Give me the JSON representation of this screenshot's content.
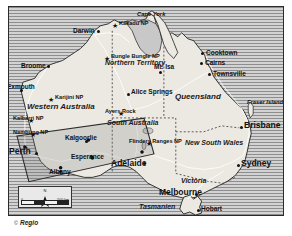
{
  "map": {
    "title": "Australia overview map",
    "language_note": "Tasmanien",
    "colors": {
      "ocean_hatch_dark": "#8d8d8d",
      "ocean_hatch_light": "#d3d3d3",
      "land_fill": "#ece9e2",
      "land_stroke": "#1f1f1f",
      "border_dotted": "#4a4a4a",
      "route_line": "#2b2b2b",
      "text": "#111111"
    },
    "cities": [
      {
        "name": "Darwin",
        "x": 88,
        "y": 26,
        "marker": "dot",
        "size": "city"
      },
      {
        "name": "Broome",
        "x": 38,
        "y": 62,
        "marker": "dot",
        "size": "city"
      },
      {
        "name": "Exmouth",
        "x": 8,
        "y": 85,
        "marker": "dot",
        "size": "city"
      },
      {
        "name": "Cooktown",
        "x": 205,
        "y": 48,
        "marker": "dot",
        "size": "city"
      },
      {
        "name": "Cairns",
        "x": 204,
        "y": 58,
        "marker": "dot",
        "size": "city"
      },
      {
        "name": "Townsville",
        "x": 212,
        "y": 69,
        "marker": "dot",
        "size": "city"
      },
      {
        "name": "Mt. Isa",
        "x": 158,
        "y": 66,
        "marker": "dot",
        "size": "city"
      },
      {
        "name": "Alice Springs",
        "x": 125,
        "y": 90,
        "marker": "dot",
        "size": "city"
      },
      {
        "name": "Kalgoorlie",
        "x": 78,
        "y": 139,
        "marker": "dot",
        "size": "city"
      },
      {
        "name": "Esperance",
        "x": 83,
        "y": 155,
        "marker": "dot",
        "size": "city"
      },
      {
        "name": "Albany",
        "x": 52,
        "y": 168,
        "marker": "dot",
        "size": "city"
      },
      {
        "name": "Perth",
        "x": 16,
        "y": 148,
        "marker": "dot",
        "size": "city-big"
      },
      {
        "name": "Adelaide",
        "x": 128,
        "y": 160,
        "marker": "dot",
        "size": "city-big"
      },
      {
        "name": "Brisbane",
        "x": 242,
        "y": 122,
        "marker": "dot",
        "size": "city-big"
      },
      {
        "name": "Sydney",
        "x": 238,
        "y": 160,
        "marker": "dot",
        "size": "city-big"
      },
      {
        "name": "Melbourne",
        "x": 188,
        "y": 195,
        "marker": "dot",
        "size": "city-big"
      },
      {
        "name": "Hobart",
        "x": 205,
        "y": 212,
        "marker": "dot",
        "size": "city"
      }
    ],
    "parks": [
      {
        "name": "Kakadu NP",
        "x": 108,
        "y": 22
      },
      {
        "name": "Bungle Bungle NP",
        "x": 100,
        "y": 56
      },
      {
        "name": "Karijini NP",
        "x": 44,
        "y": 97
      },
      {
        "name": "Kalbarri NP",
        "x": 8,
        "y": 118
      },
      {
        "name": "Nambung NP",
        "x": 10,
        "y": 132
      },
      {
        "name": "Ayers Rock",
        "x": 110,
        "y": 110
      },
      {
        "name": "Flinders Ranges NP",
        "x": 142,
        "y": 142
      }
    ],
    "states": [
      {
        "name": "Northern Territory",
        "x": 108,
        "y": 64,
        "style": "state-sm"
      },
      {
        "name": "Western Australia",
        "x": 28,
        "y": 104,
        "style": "state"
      },
      {
        "name": "South Australia",
        "x": 108,
        "y": 122,
        "style": "state-sm"
      },
      {
        "name": "Queensland",
        "x": 178,
        "y": 92,
        "style": "state"
      },
      {
        "name": "New South Wales",
        "x": 188,
        "y": 142,
        "style": "state-sm"
      },
      {
        "name": "Victoria",
        "x": 180,
        "y": 178,
        "style": "state-sm"
      },
      {
        "name": "Tasmanien",
        "x": 150,
        "y": 203,
        "style": "state-sm"
      }
    ],
    "geo_features": [
      {
        "name": "Cape York",
        "x": 150,
        "y": 15,
        "on_sea": true
      },
      {
        "name": "Fraser Island",
        "x": 248,
        "y": 104,
        "on_sea": true
      }
    ],
    "scale": {
      "north_label": "N",
      "zero_label": "0",
      "distance_label": "500 km"
    },
    "credit": {
      "symbol": "©",
      "text": "Regio"
    }
  }
}
